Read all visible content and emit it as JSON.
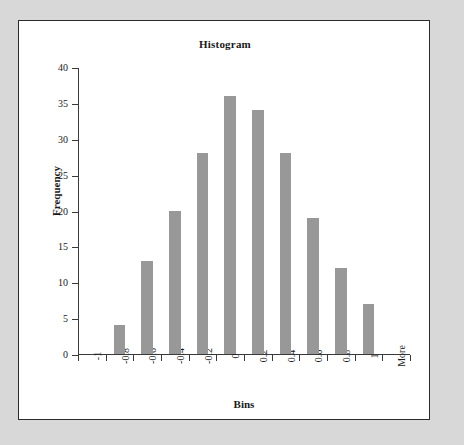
{
  "chart_data": {
    "type": "bar",
    "title": "Histogram",
    "xlabel": "Bins",
    "ylabel": "Frequency",
    "categories": [
      "-1",
      "-0.8",
      "-0.6",
      "-0.4",
      "-0.2",
      "0",
      "0.2",
      "0.4",
      "0.6",
      "0.8",
      "1",
      "More"
    ],
    "values": [
      0,
      4,
      13,
      20,
      28,
      36,
      34,
      28,
      19,
      12,
      7,
      0
    ],
    "series": [
      {
        "name": "Frequency",
        "values": [
          0,
          4,
          13,
          20,
          28,
          36,
          34,
          28,
          19,
          12,
          7,
          0
        ]
      }
    ],
    "ylim": [
      0,
      40
    ],
    "ytick_labels": [
      "0",
      "5",
      "10",
      "15",
      "20",
      "25",
      "30",
      "35",
      "40"
    ],
    "ytick_values": [
      0,
      5,
      10,
      15,
      20,
      25,
      30,
      35,
      40
    ],
    "grid": false,
    "legend": false,
    "bar_color": "#989898",
    "axis_color": "#3a3a3a",
    "plot_background": "#ffffff",
    "page_background": "#d8d8d8",
    "xtick_label_rotation": -90
  }
}
